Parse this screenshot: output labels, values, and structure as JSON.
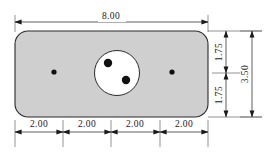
{
  "drawing": {
    "title": "Rectangular plate with rounded corners, central bore and four locating holes",
    "colors": {
      "plate_fill": "#cfcfcf",
      "plate_stroke": "#2b2b2b",
      "bore_fill": "#ffffff",
      "hole_fill": "#101010",
      "dimension_line": "#1a1a1a",
      "extension_line": "#4a4a4a",
      "background": "#ffffff"
    },
    "plate": {
      "x": 15,
      "y": 31,
      "width": 193,
      "height": 86,
      "corner_radius": 13
    },
    "bore": {
      "cx": 117,
      "cy": 73,
      "r": 22.5
    },
    "inner_holes": [
      {
        "cx": 108,
        "cy": 63,
        "r": 4.2
      },
      {
        "cx": 126,
        "cy": 80,
        "r": 4.2
      }
    ],
    "plate_holes": [
      {
        "cx": 54,
        "cy": 72,
        "r": 2.6
      },
      {
        "cx": 172,
        "cy": 72,
        "r": 2.6
      }
    ],
    "dimensions": {
      "overall_width": {
        "label": "8.00",
        "y": 22,
        "x1": 15,
        "x2": 208,
        "text_x": 111,
        "text_y": 19
      },
      "bottom_chain": {
        "y": 132,
        "segments": [
          {
            "label": "2.00",
            "x1": 15,
            "x2": 63,
            "text_x": 39
          },
          {
            "label": "2.00",
            "x1": 63,
            "x2": 111,
            "text_x": 87
          },
          {
            "label": "2.00",
            "x1": 111,
            "x2": 160,
            "text_x": 135
          },
          {
            "label": "2.00",
            "x1": 160,
            "x2": 208,
            "text_x": 184
          }
        ],
        "tick_x": [
          15,
          63,
          111,
          160,
          208
        ],
        "text_y": 127,
        "ext_top": 120,
        "ext_bottom": 147
      },
      "right_chain": {
        "x": 226,
        "segments": [
          {
            "label": "1.75",
            "y1": 31,
            "y2": 73,
            "text_y": 52
          },
          {
            "label": "1.75",
            "y1": 73,
            "y2": 117,
            "text_y": 95
          }
        ],
        "text_x": 222
      },
      "overall_height": {
        "label": "3.50",
        "x": 252,
        "y1": 31,
        "y2": 117,
        "text_x": 248,
        "text_y": 74
      },
      "extension_lines": {
        "top_left_x": 15,
        "top_right_x": 208,
        "top_y_start": 15,
        "top_y_end": 31,
        "right_y_top": 31,
        "right_y_bottom": 117,
        "right_x_start": 208,
        "right_x_end": 262
      }
    }
  }
}
